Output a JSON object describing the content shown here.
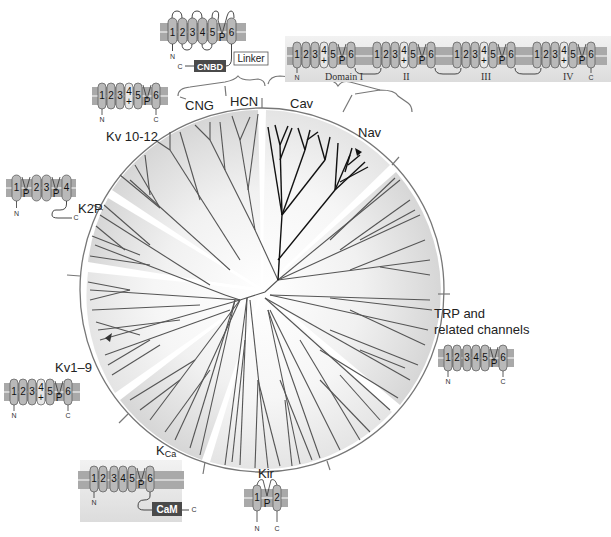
{
  "diagram": {
    "type": "phylogenetic-tree",
    "colors": {
      "membrane": "#a9a9a9",
      "membrane_stripe": "#d4d4d4",
      "segment_fill": "#b9b9b9",
      "segment_plus_fill": "#e6e6e6",
      "pore_fill": "#9a9a9a",
      "branch_gray": "#555555",
      "branch_black": "#111111",
      "circle_line": "#777777",
      "sector_shade": "#e2e2e2",
      "domain_box": "#4a4a4a",
      "inset_bg": "#e6e6e6"
    },
    "clade_labels": {
      "cng": "CNG",
      "hcn": "HCN",
      "cav": "Cav",
      "nav": "Nav",
      "kv10_12": "Kv 10-12",
      "k2p": "K2P",
      "kv1_9": "Kv1–9",
      "kca_main": "K",
      "kca_sub": "Ca",
      "kir": "Kir",
      "trp_line1": "TRP and",
      "trp_line2": "related channels"
    },
    "topology_insets": {
      "cnbd_channel": {
        "segments": [
          "1",
          "2",
          "3",
          "4",
          "5",
          "P",
          "6"
        ],
        "n_terminal": "N",
        "c_terminal": "C",
        "linker_label": "Linker",
        "domain_label": "CNBD"
      },
      "four_domain_channel": {
        "domains": [
          "Domain I",
          "II",
          "III",
          "IV"
        ],
        "segments": [
          "1",
          "2",
          "3",
          "4",
          "5",
          "P",
          "6"
        ],
        "plus_sign": "+",
        "n_terminal": "N",
        "c_terminal": "C"
      },
      "kv10_12_channel": {
        "segments": [
          "1",
          "2",
          "3",
          "4",
          "5",
          "P",
          "6"
        ],
        "plus_sign": "+",
        "n_terminal": "N",
        "c_terminal": "C"
      },
      "k2p_channel": {
        "segments": [
          "1",
          "P",
          "2",
          "3",
          "P",
          "4"
        ],
        "n_terminal": "N",
        "c_terminal": "C"
      },
      "kv1_9_channel": {
        "segments": [
          "1",
          "2",
          "3",
          "4",
          "5",
          "P",
          "6"
        ],
        "plus_sign": "+",
        "n_terminal": "N",
        "c_terminal": "C"
      },
      "kca_channel": {
        "segments": [
          "1",
          "2",
          "3",
          "4",
          "5",
          "P",
          "6"
        ],
        "n_terminal": "N",
        "c_terminal": "C",
        "domain_label": "CaM"
      },
      "kir_channel": {
        "segments": [
          "1",
          "P",
          "2"
        ],
        "n_terminal": "N",
        "c_terminal": "C"
      },
      "trp_channel": {
        "segments": [
          "1",
          "2",
          "3",
          "4",
          "5",
          "P",
          "6"
        ],
        "n_terminal": "N",
        "c_terminal": "C"
      }
    }
  }
}
